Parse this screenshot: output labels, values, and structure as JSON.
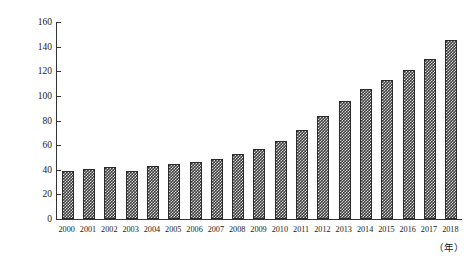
{
  "chart_data": {
    "type": "bar",
    "title": "",
    "xlabel": "（年）",
    "ylabel": "农业总产值（亿元）",
    "categories": [
      "2000",
      "2001",
      "2002",
      "2003",
      "2004",
      "2005",
      "2006",
      "2007",
      "2008",
      "2009",
      "2010",
      "2011",
      "2012",
      "2013",
      "2014",
      "2015",
      "2016",
      "2017",
      "2018"
    ],
    "values": [
      39,
      41,
      42,
      39,
      43,
      45,
      46,
      49,
      53,
      57,
      63,
      72,
      84,
      96,
      106,
      113,
      121,
      130,
      145
    ],
    "ylim": [
      0,
      160
    ],
    "yticks": [
      0,
      20,
      40,
      60,
      80,
      100,
      120,
      140,
      160
    ],
    "ytick_labels": [
      "0",
      "20",
      "40",
      "60",
      "80",
      "100",
      "120",
      "140",
      "160"
    ],
    "grid": false,
    "legend": false,
    "series_name": "农业总产值",
    "bar_color": "#3c3c3c",
    "bar_pattern": "checkerboard-dots",
    "axis_color": "#333333"
  }
}
